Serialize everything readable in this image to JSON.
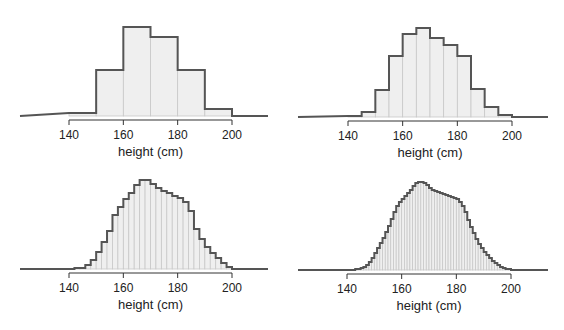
{
  "chart_data": [
    {
      "type": "bar",
      "title": "",
      "xlabel": "height (cm)",
      "ylabel": "",
      "bin_width": 10,
      "x_ticks": [
        140,
        160,
        180,
        200
      ],
      "xlim": [
        120,
        213
      ],
      "grid": false,
      "legend": null,
      "categories": [
        "140-150",
        "150-160",
        "160-170",
        "170-180",
        "180-190",
        "190-200"
      ],
      "bin_starts": [
        140,
        150,
        160,
        170,
        180,
        190
      ],
      "values": [
        3,
        46,
        89,
        79,
        46,
        7
      ],
      "value_units": "relative frequency (px height, no y-axis shown)"
    },
    {
      "type": "bar",
      "title": "",
      "xlabel": "height (cm)",
      "ylabel": "",
      "bin_width": 5,
      "x_ticks": [
        140,
        160,
        180,
        200
      ],
      "xlim": [
        120,
        213
      ],
      "grid": false,
      "legend": null,
      "bin_starts": [
        140,
        145,
        150,
        155,
        160,
        165,
        170,
        175,
        180,
        185,
        190,
        195
      ],
      "values": [
        1,
        5,
        27,
        61,
        83,
        89,
        79,
        72,
        61,
        28,
        10,
        2
      ],
      "value_units": "relative frequency (px height, no y-axis shown)"
    },
    {
      "type": "bar",
      "title": "",
      "xlabel": "height (cm)",
      "ylabel": "",
      "bin_width": 2,
      "x_ticks": [
        140,
        160,
        180,
        200
      ],
      "xlim": [
        120,
        213
      ],
      "grid": false,
      "legend": null,
      "bin_starts": [
        140,
        142,
        144,
        146,
        148,
        150,
        152,
        154,
        156,
        158,
        160,
        162,
        164,
        166,
        168,
        170,
        172,
        174,
        176,
        178,
        180,
        182,
        184,
        186,
        188,
        190,
        192,
        194,
        196,
        198
      ],
      "values": [
        0,
        1,
        1,
        4,
        9,
        17,
        27,
        38,
        54,
        62,
        70,
        76,
        84,
        89,
        89,
        85,
        81,
        78,
        76,
        73,
        71,
        67,
        58,
        40,
        30,
        22,
        16,
        11,
        6,
        2
      ],
      "value_units": "relative frequency (px height, no y-axis shown)"
    },
    {
      "type": "bar",
      "title": "",
      "xlabel": "height (cm)",
      "ylabel": "",
      "bin_width": 1,
      "x_ticks": [
        140,
        160,
        180,
        200
      ],
      "xlim": [
        120,
        213
      ],
      "grid": false,
      "legend": null,
      "bin_starts": [
        140,
        141,
        142,
        143,
        144,
        145,
        146,
        147,
        148,
        149,
        150,
        151,
        152,
        153,
        154,
        155,
        156,
        157,
        158,
        159,
        160,
        161,
        162,
        163,
        164,
        165,
        166,
        167,
        168,
        169,
        170,
        171,
        172,
        173,
        174,
        175,
        176,
        177,
        178,
        179,
        180,
        181,
        182,
        183,
        184,
        185,
        186,
        187,
        188,
        189,
        190,
        191,
        192,
        193,
        194,
        195,
        196,
        197,
        198,
        199
      ],
      "values": [
        0,
        0,
        0,
        1,
        1,
        2,
        3,
        5,
        8,
        12,
        17,
        22,
        27,
        32,
        38,
        44,
        51,
        58,
        64,
        68,
        71,
        74,
        77,
        80,
        84,
        87,
        88,
        88,
        87,
        85,
        82,
        80,
        79,
        78,
        77,
        76,
        75,
        74,
        73,
        72,
        71,
        68,
        64,
        58,
        50,
        43,
        37,
        31,
        26,
        22,
        18,
        15,
        12,
        9,
        7,
        5,
        3,
        2,
        1,
        1
      ],
      "value_units": "relative frequency (px height, no y-axis shown)"
    }
  ],
  "panels": [
    {
      "xlabel": "height (cm)",
      "ticks": [
        "140",
        "160",
        "180",
        "200"
      ]
    },
    {
      "xlabel": "height (cm)",
      "ticks": [
        "140",
        "160",
        "180",
        "200"
      ]
    },
    {
      "xlabel": "height (cm)",
      "ticks": [
        "140",
        "160",
        "180",
        "200"
      ]
    },
    {
      "xlabel": "height (cm)",
      "ticks": [
        "140",
        "160",
        "180",
        "200"
      ]
    }
  ],
  "colors": {
    "bar_fill": "#efefef",
    "bar_divider": "#c8c8c8",
    "outline": "#555555",
    "axis": "#333333"
  }
}
